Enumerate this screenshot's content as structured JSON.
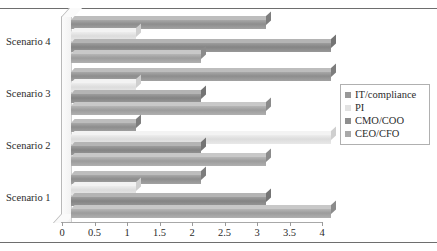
{
  "chart_data": {
    "type": "bar",
    "orientation": "horizontal",
    "title": "",
    "xlabel": "",
    "ylabel": "",
    "xlim": [
      0,
      4
    ],
    "xticks": [
      "0",
      "0.5",
      "1",
      "1.5",
      "2",
      "2.5",
      "3",
      "3.5",
      "4"
    ],
    "xtick_values": [
      0,
      0.5,
      1,
      1.5,
      2,
      2.5,
      3,
      3.5,
      4
    ],
    "grid": false,
    "legend_position": "right",
    "categories": [
      "Scenario 1",
      "Scenario 2",
      "Scenario 3",
      "Scenario 4"
    ],
    "series": [
      {
        "name": "IT/compliance",
        "color": "#989898",
        "values": [
          2,
          1,
          4,
          3
        ]
      },
      {
        "name": "PI",
        "color": "#e2e2e2",
        "values": [
          1,
          4,
          1,
          1
        ]
      },
      {
        "name": "CMO/COO",
        "color": "#8e8e8e",
        "values": [
          3,
          2,
          2,
          4
        ]
      },
      {
        "name": "CEO/CFO",
        "color": "#a9a9a9",
        "values": [
          4,
          3,
          3,
          2
        ]
      }
    ]
  },
  "legend": {
    "items": [
      {
        "label": "IT/compliance"
      },
      {
        "label": "PI"
      },
      {
        "label": "CMO/COO"
      },
      {
        "label": "CEO/CFO"
      }
    ]
  },
  "axis": {
    "category_labels": [
      "Scenario 4",
      "Scenario 3",
      "Scenario 2",
      "Scenario 1"
    ]
  }
}
